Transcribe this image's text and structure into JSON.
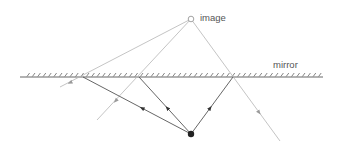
{
  "diagram": {
    "labels": {
      "image": "image",
      "mirror": "mirror"
    },
    "colors": {
      "background": "#ffffff",
      "real_ray": "#555555",
      "virtual_ray": "#b5b5b5",
      "mirror_line": "#666666",
      "object": "#222222",
      "image_point": "#999999",
      "label": "#555555"
    },
    "points": {
      "object": {
        "x": 191,
        "y": 134
      },
      "image": {
        "x": 191,
        "y": 19
      }
    },
    "mirror": {
      "y": 77,
      "x_start": 20,
      "x_end": 323
    },
    "rays": [
      {
        "name": "left",
        "reflection_point": {
          "x": 83,
          "y": 77
        },
        "virtual_end": {
          "x": 60,
          "y": 87
        }
      },
      {
        "name": "middle",
        "reflection_point": {
          "x": 139,
          "y": 77
        },
        "virtual_end": {
          "x": 97,
          "y": 120
        }
      },
      {
        "name": "right",
        "reflection_point": {
          "x": 233,
          "y": 77
        },
        "virtual_end": {
          "x": 280,
          "y": 141
        }
      }
    ]
  }
}
